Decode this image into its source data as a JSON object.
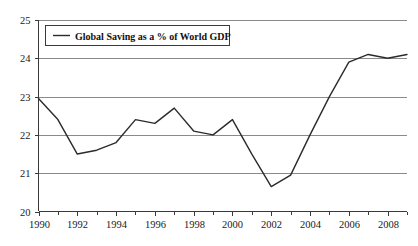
{
  "chart_data": {
    "type": "line",
    "title": "",
    "xlabel": "",
    "ylabel": "",
    "xlim": [
      1990,
      2009
    ],
    "ylim": [
      20,
      25
    ],
    "grid": true,
    "legend_position": "top-left",
    "legend": [
      "Global Saving as a % of World GDP"
    ],
    "x": [
      1990,
      1991,
      1992,
      1993,
      1994,
      1995,
      1996,
      1997,
      1998,
      1999,
      2000,
      2001,
      2002,
      2003,
      2004,
      2005,
      2006,
      2007,
      2008,
      2009
    ],
    "series": [
      {
        "name": "Global Saving as a % of World GDP",
        "values": [
          22.95,
          22.4,
          21.5,
          21.6,
          21.8,
          22.4,
          22.3,
          22.7,
          22.1,
          22.0,
          22.4,
          21.5,
          20.65,
          20.95,
          22.0,
          23.0,
          23.9,
          24.1,
          24.0,
          24.1
        ]
      }
    ],
    "y_ticks": [
      20,
      21,
      22,
      23,
      24,
      25
    ],
    "y_tick_labels": [
      "20",
      "21",
      "22",
      "23",
      "24",
      "25"
    ],
    "x_ticks": [
      1990,
      1991,
      1992,
      1993,
      1994,
      1995,
      1996,
      1997,
      1998,
      1999,
      2000,
      2001,
      2002,
      2003,
      2004,
      2005,
      2006,
      2007,
      2008,
      2009
    ],
    "x_tick_labels": [
      "1990",
      "",
      "1992",
      "",
      "1994",
      "",
      "1996",
      "",
      "1998",
      "",
      "2000",
      "",
      "2002",
      "",
      "2004",
      "",
      "2006",
      "",
      "2008",
      ""
    ],
    "colors": {
      "line": "#2b2b2b",
      "grid": "#8a8a8a",
      "axis": "#3a3a3a",
      "background": "#ffffff",
      "text": "#1a1a1a"
    }
  }
}
